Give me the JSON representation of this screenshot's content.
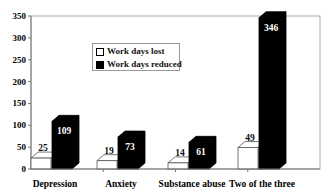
{
  "chart_data": {
    "type": "bar",
    "title": "",
    "xlabel": "",
    "ylabel": "",
    "ylim": [
      0,
      350
    ],
    "yticks": [
      0,
      50,
      100,
      150,
      200,
      250,
      300,
      350
    ],
    "grid": false,
    "legend_position": "upper-left-inside",
    "style": "3d-clustered-bar",
    "categories": [
      "Depression",
      "Anxiety",
      "Substance abuse",
      "Two of the three"
    ],
    "series": [
      {
        "name": "Work days lost",
        "color": "#ffffff",
        "values": [
          25,
          19,
          14,
          49
        ]
      },
      {
        "name": "Work days reduced",
        "color": "#000000",
        "values": [
          109,
          73,
          61,
          346
        ]
      }
    ]
  },
  "legend": {
    "items": [
      {
        "label": "Work days lost",
        "color": "#ffffff"
      },
      {
        "label": "Work days reduced",
        "color": "#000000"
      }
    ]
  }
}
